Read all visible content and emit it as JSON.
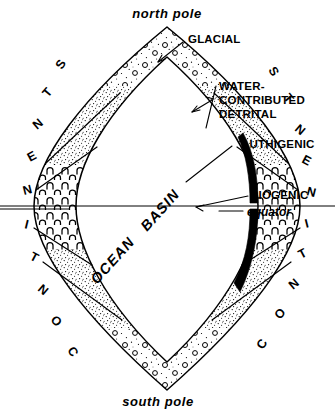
{
  "figure": {
    "title_poles": {
      "north": "north pole",
      "south": "south pole"
    },
    "center_label": {
      "line1": "OCEAN",
      "line2": "BASIN",
      "full": "OCEAN BASIN"
    },
    "equator": {
      "label": "equator"
    },
    "callouts": [
      {
        "id": "glacial",
        "label": "GLACIAL"
      },
      {
        "id": "water-contributed-detrital",
        "label": "WATER-\nCONTRIBUTED\nDETRITAL",
        "line1": "WATER-",
        "line2": "CONTRIBUTED",
        "line3": "DETRITAL"
      },
      {
        "id": "authigenic",
        "label": "AUTHIGENIC"
      },
      {
        "id": "biogenic",
        "label": "BIOGENIC"
      }
    ],
    "ring_word": {
      "text": "CONTINENTS",
      "left_top_to_bottom": [
        "S",
        "T",
        "N",
        "E",
        "N",
        "I",
        "T",
        "N",
        "O",
        "C"
      ],
      "right_top_to_bottom": [
        "S",
        "T",
        "N",
        "E",
        "N",
        "I",
        "T",
        "N",
        "O",
        "C"
      ]
    },
    "zones": [
      {
        "id": "glacial",
        "name": "GLACIAL",
        "pattern": "open-circles-and-dots"
      },
      {
        "id": "water-contributed-detrital",
        "name": "WATER-CONTRIBUTED DETRITAL",
        "pattern": "fine-stipple"
      },
      {
        "id": "authigenic",
        "name": "AUTHIGENIC",
        "pattern": "solid-black"
      },
      {
        "id": "biogenic",
        "name": "BIOGENIC",
        "pattern": "arch-marks"
      }
    ],
    "colors": {
      "background": "#ffffff",
      "ink": "#000000",
      "authigenic_fill": "#000000",
      "stipple": "#000000"
    }
  }
}
